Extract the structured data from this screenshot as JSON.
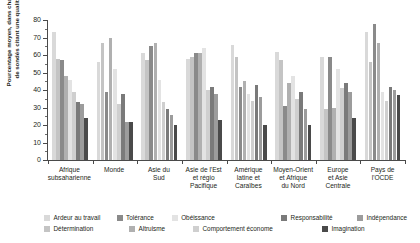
{
  "chart_data": {
    "type": "bar",
    "title": "",
    "subtitle": "",
    "xlabel": "",
    "ylabel": "Pourcentage moyen, dans chaque région,\nde sondés citant une qualité donnée",
    "ylim": [
      0,
      80
    ],
    "yticks": [
      0,
      10,
      20,
      30,
      40,
      50,
      60,
      70,
      80
    ],
    "ytick_labels": [
      "0",
      "10",
      "20",
      "30",
      "40",
      "50",
      "60",
      "70",
      "80"
    ],
    "grid": false,
    "legend_position": "bottom",
    "categories": [
      "Afrique\nsubsaharienne",
      "Monde",
      "Asie du\nSud",
      "Asie de l'Est\net régio\nPacifique",
      "Amérique\nlatine et\nCaraïbes",
      "Moyen-Orient\net Afrique\ndu Nord",
      "Europe\net Asie\nCentrale",
      "Pays de\nl'OCDE"
    ],
    "series": [
      {
        "name": "Ardeur au travail",
        "color": "#d9d9d9",
        "values": [
          73,
          56,
          61,
          58,
          66,
          62,
          59,
          73
        ]
      },
      {
        "name": "Détermination",
        "color": "#c4c4c4",
        "values": [
          58,
          67,
          57,
          59,
          59,
          57,
          29,
          56
        ]
      },
      {
        "name": "Tolérance",
        "color": "#8a8a8a",
        "values": [
          57,
          39,
          65,
          61,
          42,
          31,
          59,
          78
        ]
      },
      {
        "name": "Altruisme",
        "color": "#b0b0b0",
        "values": [
          48,
          70,
          67,
          61,
          45,
          44,
          30,
          67
        ]
      },
      {
        "name": "Obéissance",
        "color": "#e3e3e3",
        "values": [
          46,
          52,
          46,
          64,
          38,
          48,
          52,
          39
        ]
      },
      {
        "name": "Comportement économe",
        "color": "#cfcfcf",
        "values": [
          39,
          32,
          33,
          40,
          34,
          35,
          41,
          34
        ]
      },
      {
        "name": "Responsabilité",
        "color": "#7a7a7a",
        "values": [
          33,
          38,
          29,
          42,
          43,
          39,
          44,
          42
        ]
      },
      {
        "name": "Indépendance",
        "color": "#9c9c9c",
        "values": [
          32,
          22,
          26,
          38,
          36,
          29,
          39,
          40
        ]
      },
      {
        "name": "Imagination",
        "color": "#4a4a4a",
        "values": [
          24,
          22,
          20,
          23,
          20,
          20,
          24,
          37
        ]
      }
    ]
  },
  "legend": {
    "row1": [
      {
        "label": "Ardeur au travail",
        "color": "#d9d9d9"
      },
      {
        "label": "Tolérance",
        "color": "#8a8a8a"
      },
      {
        "label": "Obéissance",
        "color": "#e3e3e3"
      },
      {
        "label": "Responsabilité",
        "color": "#7a7a7a"
      },
      {
        "label": "Indépendance",
        "color": "#9c9c9c"
      }
    ],
    "row2": [
      {
        "label": "Détermination",
        "color": "#c4c4c4"
      },
      {
        "label": "Altruisme",
        "color": "#b0b0b0"
      },
      {
        "label": "Comportement économe",
        "color": "#cfcfcf"
      },
      {
        "label": "Imagination",
        "color": "#4a4a4a"
      }
    ]
  }
}
